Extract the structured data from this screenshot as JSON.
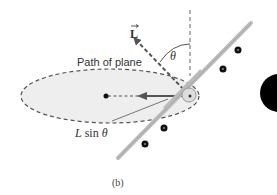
{
  "figure": {
    "caption": "(b)",
    "labels": {
      "angular_momentum": "L",
      "theta": "θ",
      "path": "Path of plane",
      "component_L": "L",
      "component_sin": " sin ",
      "component_theta": "θ"
    },
    "colors": {
      "ellipse_fill": "#eeeeee",
      "dashes": "#555555",
      "vector": "#555555",
      "wing": "#bbbbbb",
      "engine": "#111111",
      "text": "#333333",
      "large_body": "#000000"
    },
    "elements": {
      "vertical_axis": "dashed vertical reference line",
      "L_vector": "dashed angular momentum vector tilted by θ from vertical",
      "horizontal_component": "solid arrow pointing toward center of circular path",
      "ellipse": "dashed ellipse representing the circular path of plane",
      "center_dot": "center of path",
      "plane": "airplane banking, wing line with four engines",
      "large_circle": "partial black circle at right edge"
    }
  }
}
